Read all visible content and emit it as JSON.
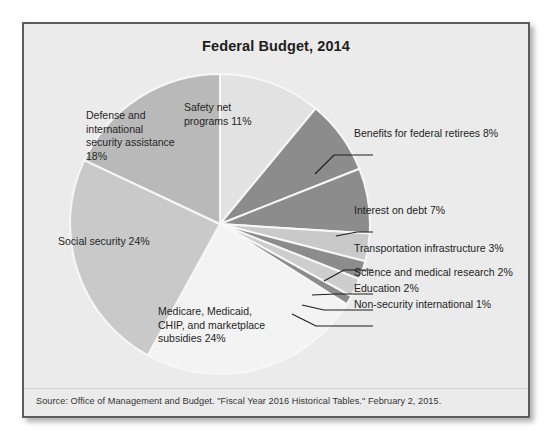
{
  "figure": {
    "title": "Federal Budget, 2014",
    "source": "Source: Office of Management and Budget. \"Fiscal Year 2016 Historical Tables.\" February 2, 2015.",
    "background_color": "#ebebeb",
    "border_color": "#5c5c5c"
  },
  "chart_data": {
    "type": "pie",
    "title": "Federal Budget, 2014",
    "xlabel": "",
    "ylabel": "",
    "legend_position": "none",
    "grid": false,
    "start_angle_deg": 0,
    "direction": "clockwise",
    "categories": [
      "Safety net programs",
      "Benefits for federal retirees",
      "Interest on debt",
      "Transportation infrastructure",
      "Science and medical research",
      "Education",
      "Non-security international",
      "Medicare, Medicaid, CHIP, and marketplace subsidies",
      "Social security",
      "Defense and international security assistance"
    ],
    "values": [
      11,
      8,
      7,
      3,
      2,
      2,
      1,
      24,
      24,
      18
    ],
    "colors": [
      "#e2e2e2",
      "#8c8c8c",
      "#8c8c8c",
      "#c9c9c9",
      "#8c8c8c",
      "#cdcdcd",
      "#8c8c8c",
      "#f3f3f3",
      "#c9c9c9",
      "#b9b9b9"
    ],
    "slices": [
      {
        "label": "Safety net programs 11%",
        "name": "Safety net programs",
        "value": 11,
        "color": "#e2e2e2",
        "label_placement": "inside"
      },
      {
        "label": "Benefits for federal retirees 8%",
        "name": "Benefits for federal retirees",
        "value": 8,
        "color": "#8c8c8c",
        "label_placement": "callout"
      },
      {
        "label": "Interest on debt 7%",
        "name": "Interest on debt",
        "value": 7,
        "color": "#8c8c8c",
        "label_placement": "callout"
      },
      {
        "label": "Transportation infrastructure 3%",
        "name": "Transportation infrastructure",
        "value": 3,
        "color": "#c9c9c9",
        "label_placement": "callout"
      },
      {
        "label": "Science and medical research 2%",
        "name": "Science and medical research",
        "value": 2,
        "color": "#8c8c8c",
        "label_placement": "callout"
      },
      {
        "label": "Education 2%",
        "name": "Education",
        "value": 2,
        "color": "#cdcdcd",
        "label_placement": "callout"
      },
      {
        "label": "Non-security international 1%",
        "name": "Non-security international",
        "value": 1,
        "color": "#8c8c8c",
        "label_placement": "callout"
      },
      {
        "label": "Medicare, Medicaid, CHIP, and marketplace subsidies 24%",
        "name": "Medicare, Medicaid, CHIP, and marketplace subsidies",
        "value": 24,
        "color": "#f3f3f3",
        "label_placement": "inside"
      },
      {
        "label": "Social security 24%",
        "name": "Social security",
        "value": 24,
        "color": "#c9c9c9",
        "label_placement": "inside"
      },
      {
        "label": "Defense and international security assistance 18%",
        "name": "Defense and international security assistance",
        "value": 18,
        "color": "#b9b9b9",
        "label_placement": "inside"
      }
    ]
  },
  "inside_labels": {
    "safety_net": "Safety net\nprograms 11%",
    "defense": "Defense and\ninternational\nsecurity assistance\n18%",
    "social_security": "Social security 24%",
    "medicare": "Medicare, Medicaid,\nCHIP, and marketplace\nsubsidies 24%"
  },
  "callout_labels": {
    "retirees": "Benefits for federal retirees 8%",
    "interest": "Interest on debt 7%",
    "transportation": "Transportation infrastructure 3%",
    "science": "Science and medical research 2%",
    "education": "Education 2%",
    "nonsecurity": "Non-security international 1%"
  }
}
